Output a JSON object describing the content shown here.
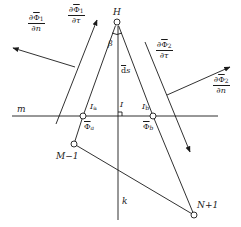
{
  "diagram": {
    "colors": {
      "stroke": "#1a1a1a",
      "background": "#ffffff"
    },
    "points": {
      "H": {
        "label": "H",
        "x": 117,
        "y": 22
      },
      "I": {
        "label": "I",
        "x": 118,
        "y": 116
      },
      "Ia": {
        "label": "I",
        "sub": "a",
        "x": 83,
        "y": 116
      },
      "Ib": {
        "label": "I",
        "sub": "b",
        "x": 153,
        "y": 116
      },
      "M1": {
        "label": "M−1",
        "x": 74,
        "y": 144
      },
      "N1": {
        "label": "N+1",
        "x": 194,
        "y": 215
      }
    },
    "labels": {
      "H": "H",
      "beta": "β",
      "ds": "ds",
      "ds_prefix": "d",
      "ds_var": "s",
      "m": "m",
      "k": "k",
      "I": "I",
      "Ia_main": "I",
      "Ia_sub": "a",
      "Ib_main": "I",
      "Ib_sub": "b",
      "phi_a_main": "Φ",
      "phi_a_sub": "a",
      "phi_b_main": "Φ",
      "phi_b_sub": "b",
      "M1": "M−1",
      "N1": "N+1"
    },
    "fractions": {
      "dphi1_dn": {
        "num_prefix": "∂",
        "num_var": "Φ",
        "num_sub": "1",
        "den": "∂n"
      },
      "dphi1_dtau": {
        "num_prefix": "∂",
        "num_var": "Φ",
        "num_sub": "1",
        "den": "∂τ"
      },
      "dphi2_dtau": {
        "num_prefix": "∂",
        "num_var": "Φ",
        "num_sub": "2",
        "den": "∂τ"
      },
      "dphi2_dn": {
        "num_prefix": "∂",
        "num_var": "Φ",
        "num_sub": "2",
        "den": "∂n"
      }
    }
  }
}
